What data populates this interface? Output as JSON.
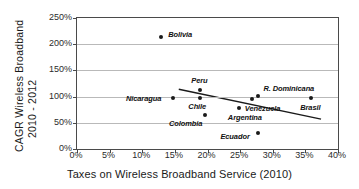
{
  "chart_data": {
    "type": "scatter",
    "title": "",
    "xlabel": "Taxes on Wireless Broadband Service (2010)",
    "ylabel_line1": "CAGR  Wireless Broadband",
    "ylabel_line2": "2010 - 2012",
    "xlim": [
      0,
      40
    ],
    "ylim": [
      0,
      250
    ],
    "xticks": [
      "0%",
      "5%",
      "10%",
      "15%",
      "20%",
      "25%",
      "30%",
      "35%",
      "40%"
    ],
    "xtick_values": [
      0,
      5,
      10,
      15,
      20,
      25,
      30,
      35,
      40
    ],
    "yticks": [
      "0%",
      "50%",
      "100%",
      "150%",
      "200%",
      "250%"
    ],
    "ytick_values": [
      0,
      50,
      100,
      150,
      200,
      250
    ],
    "grid": "horizontal",
    "legend": "none",
    "marker_color": "#1a1a1a",
    "trendline_color": "#1a1a1a",
    "gridline_color": "#b9b9b9",
    "axis_color": "#4a4a4a",
    "points": [
      {
        "label": "Bolivia",
        "x": 12.9,
        "y": 213,
        "label_dx": 7,
        "label_dy": -3
      },
      {
        "label": "Nicaragua",
        "x": 14.7,
        "y": 97,
        "label_dx": -47,
        "label_dy": 0
      },
      {
        "label": "Peru",
        "x": 18.9,
        "y": 113,
        "label_dx": -9,
        "label_dy": -10
      },
      {
        "label": "Chile",
        "x": 18.9,
        "y": 97,
        "label_dx": -12,
        "label_dy": 8
      },
      {
        "label": "Colombia",
        "x": 19.6,
        "y": 64,
        "label_dx": -36,
        "label_dy": 8
      },
      {
        "label": "Argentina",
        "x": 24.8,
        "y": 79,
        "label_dx": -11,
        "label_dy": 9
      },
      {
        "label": "Venezuela",
        "x": 26.8,
        "y": 95,
        "label_dx": -7,
        "label_dy": 9
      },
      {
        "label": "R. Dominicana",
        "x": 27.8,
        "y": 102,
        "label_dx": 5,
        "label_dy": -8
      },
      {
        "label": "Ecuador",
        "x": 27.8,
        "y": 31,
        "label_dx": -38,
        "label_dy": 3
      },
      {
        "label": "Brasil",
        "x": 35.9,
        "y": 98,
        "label_dx": -11,
        "label_dy": 9
      }
    ],
    "trendline": {
      "x1": 15.6,
      "y1": 114,
      "x2": 37.4,
      "y2": 57
    }
  }
}
